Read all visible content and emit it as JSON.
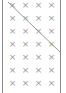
{
  "grid": {
    "columns": 4,
    "rows": 7,
    "glyph": "×",
    "mark_color": "#9a9a9a",
    "col_x": [
      12,
      25,
      38,
      51
    ],
    "row_y": [
      5,
      18,
      31,
      44,
      57,
      70,
      83
    ]
  },
  "diagonal": {
    "x1": 8,
    "y1": 2,
    "x2": 60,
    "y2": 52,
    "color": "#9a9a9a"
  },
  "border_color": "#8a8a8a"
}
